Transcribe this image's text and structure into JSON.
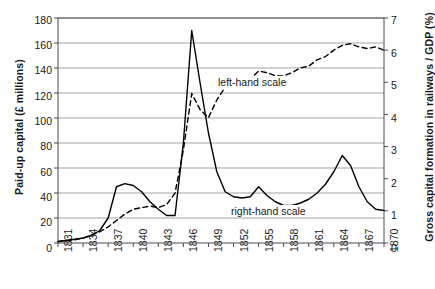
{
  "chart_data": {
    "type": "line",
    "title": "",
    "xlabel": "",
    "ylabel": "Paid-up capital (£ millions)",
    "y2label": "Gross capital formation in railways / GDP (%)",
    "grid": true,
    "legend_position": "in-plot annotations",
    "xlim": [
      1831,
      1870
    ],
    "ylim": [
      0,
      180
    ],
    "y2lim": [
      0,
      7
    ],
    "xticks": [
      1831,
      1834,
      1837,
      1840,
      1843,
      1846,
      1849,
      1852,
      1855,
      1858,
      1861,
      1864,
      1867,
      1870
    ],
    "yticks": [
      0,
      20,
      40,
      60,
      80,
      100,
      120,
      140,
      160,
      180
    ],
    "y2ticks": [
      0,
      1,
      2,
      3,
      4,
      5,
      6,
      7
    ],
    "annotations": [
      {
        "text": "left-hand scale",
        "refers_to": "Paid-up capital (£ millions)"
      },
      {
        "text": "right-hand scale",
        "refers_to": "Gross capital formation in railways / GDP (%)"
      }
    ],
    "x": [
      1831,
      1832,
      1833,
      1834,
      1835,
      1836,
      1837,
      1838,
      1839,
      1840,
      1841,
      1842,
      1843,
      1844,
      1845,
      1846,
      1847,
      1848,
      1849,
      1850,
      1851,
      1852,
      1853,
      1854,
      1855,
      1856,
      1857,
      1858,
      1859,
      1860,
      1861,
      1862,
      1863,
      1864,
      1865,
      1866,
      1867,
      1868,
      1869,
      1870
    ],
    "series": [
      {
        "name": "Paid-up capital (£ millions)",
        "axis": "left",
        "style": "solid",
        "color": "#000000",
        "values": [
          1,
          2,
          3,
          4,
          6,
          10,
          20,
          45,
          47.5,
          46,
          41,
          33,
          27,
          22,
          22,
          80,
          170,
          128,
          88,
          57,
          41,
          37,
          36,
          37,
          45,
          38,
          33,
          30,
          30,
          32,
          35,
          40,
          47,
          57,
          70,
          62,
          45,
          33,
          27,
          26
        ]
      },
      {
        "name": "Gross capital formation in railways / GDP (%)",
        "axis": "right",
        "style": "dashed",
        "color": "#000000",
        "values": [
          0.05,
          0.08,
          0.1,
          0.15,
          0.25,
          0.35,
          0.5,
          0.7,
          0.9,
          1.05,
          1.1,
          1.15,
          1.1,
          1.2,
          1.55,
          2.9,
          4.65,
          4.15,
          3.9,
          4.45,
          4.85,
          5.0,
          4.95,
          5.1,
          5.35,
          5.3,
          5.2,
          5.2,
          5.3,
          5.45,
          5.5,
          5.7,
          5.8,
          6.0,
          6.15,
          6.2,
          6.1,
          6.05,
          6.1,
          6.0
        ]
      }
    ]
  },
  "axes": {
    "y_left_title": "Paid-up capital (£ millions)",
    "y_right_title": "Gross capital formation in railways / GDP (%)",
    "y_left_ticks": [
      "180",
      "160",
      "140",
      "120",
      "100",
      "80",
      "60",
      "40",
      "20",
      "0"
    ],
    "y_right_ticks": [
      "7",
      "6",
      "5",
      "4",
      "3",
      "2",
      "1",
      "0"
    ],
    "x_ticks": [
      "1831",
      "1834",
      "1837",
      "1840",
      "1843",
      "1846",
      "1849",
      "1852",
      "1855",
      "1858",
      "1861",
      "1864",
      "1867",
      "1870"
    ]
  },
  "annotations": {
    "left_scale_label": "left-hand scale",
    "right_scale_label": "right-hand scale"
  },
  "colors": {
    "line": "#000000",
    "grid": "#9a9a9a",
    "axis": "#4d4d4d",
    "text": "#1a1a1a",
    "background": "#ffffff"
  }
}
